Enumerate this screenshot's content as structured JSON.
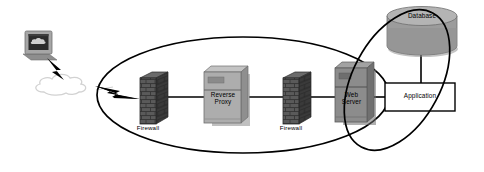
{
  "diagram": {
    "type": "network-topology",
    "background": "#ffffff",
    "line_color": "#000000",
    "nodes": [
      {
        "id": "client",
        "label": "",
        "icon": "computer-monitor-icon",
        "shape": "monitor",
        "color": "#9a9a9a",
        "screen_color": "#2b2b2b",
        "x": 22,
        "y": 30,
        "w": 36,
        "h": 30
      },
      {
        "id": "internet",
        "label": "",
        "icon": "cloud-icon",
        "shape": "cloud",
        "color": "#dcdcdc",
        "x": 33,
        "y": 76,
        "w": 62,
        "h": 28
      },
      {
        "id": "firewall-outer",
        "label": "Firewall",
        "icon": "brick-wall-icon",
        "shape": "brick-wall",
        "color": "#4a4a4a",
        "x": 140,
        "y": 72,
        "w": 28,
        "h": 52
      },
      {
        "id": "reverse-proxy",
        "label": "Reverse\nProxy",
        "icon": "server-tower-icon",
        "shape": "server-tower",
        "color": "#a8a8a8",
        "x": 204,
        "y": 66,
        "w": 46,
        "h": 60
      },
      {
        "id": "firewall-inner",
        "label": "Firewall",
        "icon": "brick-wall-icon",
        "shape": "brick-wall",
        "color": "#4a4a4a",
        "x": 283,
        "y": 72,
        "w": 28,
        "h": 52
      },
      {
        "id": "web-server",
        "label": "Web\nServer",
        "icon": "server-tower-icon",
        "shape": "server-tower",
        "color": "#8c8c8c",
        "x": 335,
        "y": 62,
        "w": 41,
        "h": 63
      },
      {
        "id": "application",
        "label": "Application",
        "icon": "rectangle-box-icon",
        "shape": "rectangle",
        "color": "#ffffff",
        "x": 385,
        "y": 83,
        "w": 70,
        "h": 28
      },
      {
        "id": "database",
        "label": "Database",
        "icon": "database-cylinder-icon",
        "shape": "cylinder",
        "color": "#9c9c9c",
        "x": 387,
        "y": 6,
        "w": 70,
        "h": 48
      }
    ],
    "zones": [
      {
        "id": "dmz-zone",
        "label": "",
        "shape": "ellipse",
        "cx": 243,
        "cy": 95,
        "rx": 146,
        "ry": 58,
        "rotate": 0
      },
      {
        "id": "application-zone",
        "label": "",
        "shape": "ellipse",
        "cx": 397,
        "cy": 80,
        "rx": 44,
        "ry": 76,
        "rotate": 28
      }
    ],
    "links": [
      {
        "id": "client-to-internet",
        "style": "lightning-bolt",
        "from": "client",
        "to": "internet"
      },
      {
        "id": "internet-to-firewall",
        "style": "lightning-bolt",
        "from": "internet",
        "to": "firewall-outer"
      },
      {
        "id": "firewall-to-proxy",
        "style": "solid-line",
        "from": "firewall-outer",
        "to": "reverse-proxy"
      },
      {
        "id": "proxy-to-firewall",
        "style": "solid-line",
        "from": "reverse-proxy",
        "to": "firewall-inner"
      },
      {
        "id": "firewall-to-web",
        "style": "solid-line",
        "from": "firewall-inner",
        "to": "web-server"
      },
      {
        "id": "web-to-application",
        "style": "solid-line",
        "from": "web-server",
        "to": "application"
      },
      {
        "id": "application-to-database",
        "style": "solid-line",
        "from": "application",
        "to": "database"
      }
    ]
  }
}
